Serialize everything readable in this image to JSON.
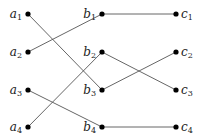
{
  "diagram": {
    "type": "layered-bipartite-graph",
    "columns": [
      "a",
      "b",
      "c"
    ],
    "nodes": [
      {
        "id": "a1",
        "letter": "a",
        "index": "1",
        "x": 28,
        "y": 14,
        "label_side": "left"
      },
      {
        "id": "a2",
        "letter": "a",
        "index": "2",
        "x": 28,
        "y": 52,
        "label_side": "left"
      },
      {
        "id": "a3",
        "letter": "a",
        "index": "3",
        "x": 28,
        "y": 90,
        "label_side": "left"
      },
      {
        "id": "a4",
        "letter": "a",
        "index": "4",
        "x": 28,
        "y": 127,
        "label_side": "left"
      },
      {
        "id": "b1",
        "letter": "b",
        "index": "1",
        "x": 102,
        "y": 14,
        "label_side": "left"
      },
      {
        "id": "b2",
        "letter": "b",
        "index": "2",
        "x": 102,
        "y": 52,
        "label_side": "left"
      },
      {
        "id": "b3",
        "letter": "b",
        "index": "3",
        "x": 102,
        "y": 90,
        "label_side": "left"
      },
      {
        "id": "b4",
        "letter": "b",
        "index": "4",
        "x": 102,
        "y": 127,
        "label_side": "left"
      },
      {
        "id": "c1",
        "letter": "c",
        "index": "1",
        "x": 176,
        "y": 14,
        "label_side": "right"
      },
      {
        "id": "c2",
        "letter": "c",
        "index": "2",
        "x": 176,
        "y": 52,
        "label_side": "right"
      },
      {
        "id": "c3",
        "letter": "c",
        "index": "3",
        "x": 176,
        "y": 90,
        "label_side": "right"
      },
      {
        "id": "c4",
        "letter": "c",
        "index": "4",
        "x": 176,
        "y": 127,
        "label_side": "right"
      }
    ],
    "edges": [
      {
        "from": "a1",
        "to": "b3"
      },
      {
        "from": "a2",
        "to": "b1"
      },
      {
        "from": "a3",
        "to": "b4"
      },
      {
        "from": "a4",
        "to": "b2"
      },
      {
        "from": "b1",
        "to": "c1"
      },
      {
        "from": "b2",
        "to": "c3"
      },
      {
        "from": "b3",
        "to": "c2"
      },
      {
        "from": "b4",
        "to": "c4"
      }
    ],
    "colors": {
      "node": "#000000",
      "edge": "#555555",
      "label": "#222222",
      "background": "#ffffff"
    }
  }
}
